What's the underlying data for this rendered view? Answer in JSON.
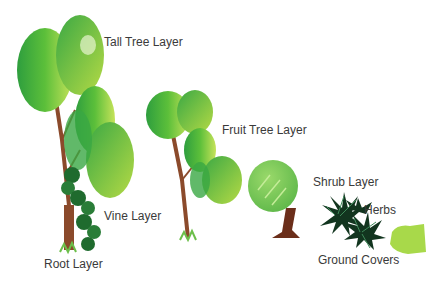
{
  "diagram": {
    "labels": {
      "tall_tree": "Tall Tree Layer",
      "fruit_tree": "Fruit Tree Layer",
      "shrub": "Shrub Layer",
      "herbs": "Herbs",
      "vine": "Vine Layer",
      "root": "Root Layer",
      "ground_covers": "Ground Covers"
    },
    "colors": {
      "leaf_dark": "#2e9e3e",
      "leaf_mid": "#5cbf3a",
      "leaf_light": "#b9dd4a",
      "trunk": "#8b4a2b",
      "vine": "#1f6b2e",
      "herb": "#12351f",
      "text": "#3a3a3a"
    }
  }
}
